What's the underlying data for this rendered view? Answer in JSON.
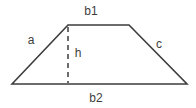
{
  "diagram": {
    "shape": "trapezoid",
    "labels": {
      "top_base": "b1",
      "left_side": "a",
      "right_side": "c",
      "height": "h",
      "bottom_base": "b2"
    }
  },
  "colors": {
    "stroke": "#3d3d3d",
    "background": "#ffffff"
  }
}
